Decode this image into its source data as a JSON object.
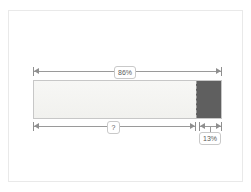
{
  "diagram": {
    "frame": {
      "visible": true,
      "border_color": "#e9e9e9"
    },
    "bar": {
      "major_segment": {
        "name": "light-segment",
        "percent": 86,
        "fill_color": "#f4f4f2",
        "border_color": "#c7c7c7"
      },
      "minor_segment": {
        "name": "dark-segment",
        "percent": 13,
        "fill_color": "#5f5f5f"
      },
      "divider_style": "dashed",
      "divider_color": "#9d9d9d"
    },
    "dimensions": [
      {
        "id": "total",
        "position": "top",
        "label": "86%",
        "spans": "full-bar",
        "line_color": "#9a9a9a"
      },
      {
        "id": "unknown",
        "position": "bottom",
        "label": "?",
        "spans": "light-segment",
        "line_color": "#9a9a9a"
      },
      {
        "id": "minor",
        "position": "bottom-right",
        "label": "13%",
        "spans": "dark-segment",
        "line_color": "#9a9a9a"
      }
    ]
  },
  "chart_data": {
    "type": "bar",
    "title": "",
    "orientation": "horizontal-stacked",
    "categories": [
      "light-segment",
      "dark-segment"
    ],
    "values": [
      86,
      13
    ],
    "labels": [
      "86%",
      "13%"
    ],
    "annotations": [
      {
        "label": "86%",
        "target": "total-span",
        "placement": "above"
      },
      {
        "label": "?",
        "target": "light-segment-span",
        "placement": "below"
      },
      {
        "label": "13%",
        "target": "dark-segment-span",
        "placement": "below"
      }
    ],
    "xlabel": "",
    "ylabel": "",
    "grid": false,
    "legend": "none"
  }
}
